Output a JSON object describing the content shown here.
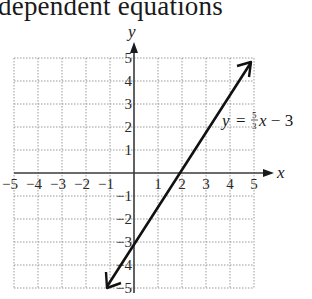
{
  "header": {
    "title": "dependent equations"
  },
  "chart_data": {
    "type": "line",
    "title": "dependent equations",
    "xlabel": "x",
    "ylabel": "y",
    "xlim": [
      -5,
      5
    ],
    "ylim": [
      -5,
      5
    ],
    "grid": true,
    "x_ticks": [
      "-5",
      "-4",
      "-3",
      "-2",
      "-1",
      "1",
      "2",
      "3",
      "4",
      "5"
    ],
    "y_ticks": [
      "5",
      "4",
      "3",
      "2",
      "1",
      "-1",
      "-2",
      "-3",
      "-4",
      "-5"
    ],
    "series": [
      {
        "name": "y = 5/3 x - 3",
        "equation": "y = (5/3)x - 3",
        "slope": 1.6667,
        "intercept": -3,
        "x": [
          -1.2,
          0,
          1.8,
          4.8
        ],
        "y": [
          -5,
          -3,
          0,
          5
        ]
      }
    ],
    "annotations": [
      {
        "text": "y = 5/3 x - 3",
        "position": [
          4.1,
          2.3
        ]
      }
    ]
  },
  "labels": {
    "x_axis": "x",
    "y_axis": "y",
    "eq_y": "y",
    "eq_eq": "=",
    "eq_num": "5",
    "eq_den": "3",
    "eq_rest": "x − 3"
  }
}
